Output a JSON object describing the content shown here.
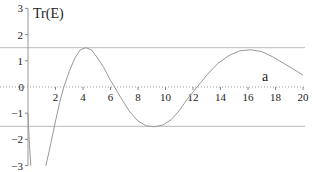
{
  "chart_data": {
    "type": "line",
    "title": "",
    "xlabel": "a",
    "ylabel": "Tr(E)",
    "xlim": [
      0,
      20
    ],
    "ylim": [
      -3,
      3
    ],
    "x_ticks": [
      "2",
      "4",
      "6",
      "8",
      "10",
      "12",
      "14",
      "16",
      "18",
      "20"
    ],
    "y_ticks": [
      "-3",
      "-2",
      "-1",
      "0",
      "1",
      "2",
      "3"
    ],
    "reference_lines": [
      1.5,
      -1.5
    ],
    "series": [
      {
        "name": "Tr(E) left branch",
        "x": [
          0.0,
          0.1,
          0.2
        ],
        "y": [
          -1.0,
          -2.2,
          -3.0
        ]
      },
      {
        "name": "Tr(E)",
        "x": [
          1.3,
          1.6,
          2.0,
          2.3,
          2.6,
          3.0,
          3.4,
          3.8,
          4.2,
          4.6,
          5.0,
          5.5,
          6.0,
          6.3,
          6.8,
          7.4,
          8.0,
          8.6,
          9.2,
          9.8,
          10.4,
          11.0,
          11.6,
          12.3,
          13.0,
          13.8,
          14.6,
          15.4,
          16.2,
          17.0,
          17.8,
          18.6,
          19.4,
          20.0
        ],
        "y": [
          -3.0,
          -2.3,
          -1.3,
          -0.6,
          0.0,
          0.6,
          1.1,
          1.42,
          1.5,
          1.42,
          1.15,
          0.75,
          0.25,
          0.0,
          -0.45,
          -0.95,
          -1.3,
          -1.48,
          -1.52,
          -1.45,
          -1.25,
          -0.9,
          -0.45,
          0.0,
          0.45,
          0.9,
          1.2,
          1.38,
          1.42,
          1.35,
          1.15,
          0.9,
          0.65,
          0.45
        ]
      }
    ]
  }
}
